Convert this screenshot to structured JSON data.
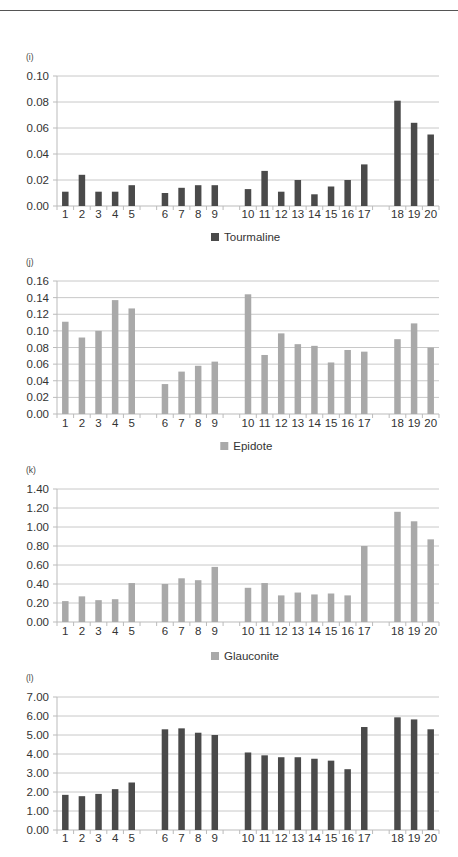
{
  "chart_data": [
    {
      "type": "bar",
      "panel_label": "(i)",
      "title": "",
      "legend": "Tourmaline",
      "legend_position": "bottom-center",
      "color": "#4a4a4a",
      "categories": [
        "1",
        "2",
        "3",
        "4",
        "5",
        "",
        "6",
        "7",
        "8",
        "9",
        "",
        "10",
        "11",
        "12",
        "13",
        "14",
        "15",
        "16",
        "17",
        "",
        "18",
        "19",
        "20"
      ],
      "values": [
        0.011,
        0.024,
        0.011,
        0.011,
        0.016,
        null,
        0.01,
        0.014,
        0.016,
        0.016,
        null,
        0.013,
        0.027,
        0.011,
        0.02,
        0.009,
        0.015,
        0.02,
        0.032,
        null,
        0.081,
        0.064,
        0.055
      ],
      "ylim": [
        0,
        0.1
      ],
      "yticks": [
        "0.00",
        "0.02",
        "0.04",
        "0.06",
        "0.08",
        "0.10"
      ],
      "grid": true,
      "xlabel": "",
      "ylabel": ""
    },
    {
      "type": "bar",
      "panel_label": "(j)",
      "title": "",
      "legend": "Epidote",
      "legend_position": "bottom-center",
      "color": "#a9a9a9",
      "categories": [
        "1",
        "2",
        "3",
        "4",
        "5",
        "",
        "6",
        "7",
        "8",
        "9",
        "",
        "10",
        "11",
        "12",
        "13",
        "14",
        "15",
        "16",
        "17",
        "",
        "18",
        "19",
        "20"
      ],
      "values": [
        0.111,
        0.092,
        0.1,
        0.137,
        0.127,
        null,
        0.036,
        0.051,
        0.058,
        0.063,
        null,
        0.144,
        0.071,
        0.097,
        0.084,
        0.082,
        0.062,
        0.077,
        0.075,
        null,
        0.09,
        0.109,
        0.08
      ],
      "ylim": [
        0,
        0.16
      ],
      "yticks": [
        "0.00",
        "0.02",
        "0.04",
        "0.06",
        "0.08",
        "0.10",
        "0.12",
        "0.14",
        "0.16"
      ],
      "grid": true,
      "xlabel": "",
      "ylabel": ""
    },
    {
      "type": "bar",
      "panel_label": "(k)",
      "title": "",
      "legend": "Glauconite",
      "legend_position": "bottom-center",
      "color": "#a9a9a9",
      "categories": [
        "1",
        "2",
        "3",
        "4",
        "5",
        "",
        "6",
        "7",
        "8",
        "9",
        "",
        "10",
        "11",
        "12",
        "13",
        "14",
        "15",
        "16",
        "17",
        "",
        "18",
        "19",
        "20"
      ],
      "values": [
        0.22,
        0.27,
        0.23,
        0.24,
        0.41,
        null,
        0.4,
        0.46,
        0.44,
        0.58,
        null,
        0.36,
        0.41,
        0.28,
        0.31,
        0.29,
        0.3,
        0.28,
        0.8,
        null,
        1.16,
        1.06,
        0.87
      ],
      "ylim": [
        0,
        1.4
      ],
      "yticks": [
        "0.00",
        "0.20",
        "0.40",
        "0.60",
        "0.80",
        "1.00",
        "1.20",
        "1.40"
      ],
      "grid": true,
      "xlabel": "",
      "ylabel": ""
    },
    {
      "type": "bar",
      "panel_label": "(l)",
      "title": "",
      "legend": "",
      "legend_position": "",
      "color": "#4a4a4a",
      "categories": [
        "1",
        "2",
        "3",
        "4",
        "5",
        "",
        "6",
        "7",
        "8",
        "9",
        "",
        "10",
        "11",
        "12",
        "13",
        "14",
        "15",
        "16",
        "17",
        "",
        "18",
        "19",
        "20"
      ],
      "values": [
        1.85,
        1.78,
        1.9,
        2.15,
        2.5,
        null,
        5.3,
        5.35,
        5.12,
        5.0,
        null,
        4.08,
        3.93,
        3.83,
        3.83,
        3.75,
        3.65,
        3.2,
        5.42,
        null,
        5.93,
        5.82,
        5.3
      ],
      "ylim": [
        0,
        7.0
      ],
      "yticks": [
        "0.00",
        "1.00",
        "2.00",
        "3.00",
        "4.00",
        "5.00",
        "6.00",
        "7.00"
      ],
      "grid": true,
      "xlabel": "",
      "ylabel": ""
    }
  ]
}
